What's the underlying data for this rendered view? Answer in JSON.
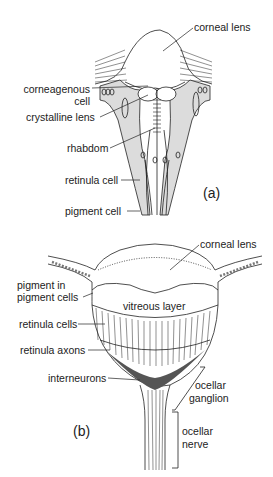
{
  "diagram": {
    "panel_a": {
      "tag": "(a)",
      "labels": {
        "corneal_lens": "corneal lens",
        "corneagenous_cell_1": "corneagenous",
        "corneagenous_cell_2": "cell",
        "crystalline_lens": "crystalline lens",
        "rhabdom": "rhabdom",
        "retinula_cell": "retinula cell",
        "pigment_cell": "pigment cell"
      }
    },
    "panel_b": {
      "tag": "(b)",
      "labels": {
        "corneal_lens": "corneal lens",
        "pigment_in_1": "pigment in",
        "pigment_in_2": "pigment cells",
        "vitreous_layer": "vitreous layer",
        "retinula_cells": "retinula cells",
        "retinula_axons": "retinula axons",
        "interneurons": "interneurons",
        "ocellar_ganglion_1": "ocellar",
        "ocellar_ganglion_2": "ganglion",
        "ocellar_nerve_1": "ocellar",
        "ocellar_nerve_2": "nerve"
      }
    },
    "colors": {
      "line": "#222222",
      "shade": "#d9d9d9",
      "dark": "#555555"
    }
  }
}
